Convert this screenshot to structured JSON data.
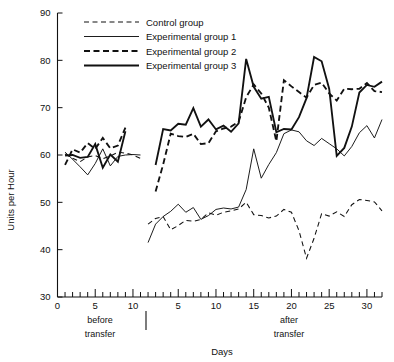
{
  "chart_data": {
    "type": "line",
    "title": "",
    "xlabel": "Days",
    "ylabel": "Units per Hour",
    "ylim": [
      30,
      90
    ],
    "y_ticks": [
      30,
      40,
      50,
      60,
      70,
      80,
      90
    ],
    "grid": false,
    "legend_position": "top-left",
    "x_sections": [
      {
        "name": "before transfer",
        "label_line1": "before",
        "label_line2": "transfer",
        "xlim": [
          0,
          11
        ],
        "ticks_labeled": [
          0,
          5,
          10
        ],
        "tick_step": 1
      },
      {
        "name": "after transfer",
        "label_line1": "after",
        "label_line2": "transfer",
        "xlim": [
          0,
          32
        ],
        "ticks_labeled": [
          5,
          10,
          15,
          20,
          25,
          30
        ],
        "tick_step": 1
      }
    ],
    "series": [
      {
        "name": "Control group",
        "style": "thin-dashed",
        "before": {
          "x": [
            1,
            2,
            3,
            4,
            5,
            6,
            7,
            8,
            9,
            10,
            11
          ],
          "y": [
            60.2,
            59.3,
            58.6,
            59.6,
            59.9,
            59.2,
            59.8,
            60.6,
            60.4,
            60.0,
            59.3
          ]
        },
        "after": {
          "x": [
            1,
            2,
            3,
            4,
            5,
            6,
            7,
            8,
            9,
            10,
            11,
            12,
            13,
            14,
            15,
            16,
            17,
            18,
            19,
            20,
            21,
            22,
            23,
            24,
            25,
            26,
            27,
            28,
            29,
            30,
            31,
            32
          ],
          "y": [
            45.4,
            46.6,
            47.0,
            44.2,
            45.1,
            46.2,
            46.0,
            46.4,
            47.8,
            47.3,
            47.9,
            48.2,
            48.6,
            50.0,
            47.4,
            47.2,
            46.7,
            47.1,
            48.5,
            47.9,
            44.0,
            38.2,
            42.4,
            47.6,
            47.1,
            48.0,
            47.0,
            49.5,
            50.6,
            50.4,
            50.1,
            48.2
          ]
        }
      },
      {
        "name": "Experimental group 1",
        "style": "thin-solid",
        "before": {
          "x": [
            1,
            2,
            3,
            4,
            5,
            6,
            7,
            8,
            9,
            10,
            11
          ],
          "y": [
            60.6,
            59.1,
            57.5,
            55.8,
            58.2,
            61.3,
            57.7,
            59.7,
            60.0,
            60.1,
            60.0
          ]
        },
        "after": {
          "x": [
            1,
            2,
            3,
            4,
            5,
            6,
            7,
            8,
            9,
            10,
            11,
            12,
            13,
            14,
            15,
            16,
            17,
            18,
            19,
            20,
            21,
            22,
            23,
            24,
            25,
            26,
            27,
            28,
            29,
            30,
            31,
            32
          ],
          "y": [
            41.5,
            45.4,
            47.0,
            48.1,
            49.6,
            47.9,
            48.9,
            46.4,
            47.2,
            48.5,
            48.8,
            48.6,
            49.0,
            52.7,
            61.3,
            55.1,
            58.0,
            60.5,
            64.5,
            65.3,
            64.9,
            63.0,
            62.0,
            63.5,
            62.4,
            61.3,
            59.8,
            61.8,
            64.7,
            66.2,
            63.6,
            67.5
          ]
        }
      },
      {
        "name": "Experimental group 2",
        "style": "thick-dashed",
        "before": {
          "x": [
            1,
            2,
            3,
            4,
            5,
            6,
            7,
            8,
            9
          ],
          "y": [
            57.9,
            61.2,
            60.5,
            62.5,
            61.3,
            63.6,
            61.4,
            62.0,
            65.8
          ]
        },
        "after": {
          "x": [
            2,
            3,
            4,
            5,
            6,
            7,
            8,
            9,
            10,
            11,
            12,
            13,
            14,
            15,
            16,
            17,
            18,
            19,
            20,
            21,
            22,
            23,
            24,
            25,
            26,
            27,
            28,
            29,
            30,
            31,
            32
          ],
          "y": [
            52.3,
            58.0,
            64.5,
            64.0,
            63.8,
            64.5,
            62.3,
            62.5,
            65.0,
            65.6,
            66.0,
            67.0,
            72.2,
            74.9,
            73.0,
            70.0,
            62.9,
            75.8,
            74.5,
            73.3,
            72.1,
            74.8,
            75.3,
            73.0,
            71.5,
            74.0,
            73.9,
            74.0,
            75.2,
            73.5,
            73.3
          ]
        }
      },
      {
        "name": "Experimental group 3",
        "style": "thick-solid",
        "before": {
          "x": [
            1,
            2,
            3,
            4,
            5,
            6,
            7,
            8,
            9
          ],
          "y": [
            59.9,
            60.0,
            59.4,
            59.6,
            62.3,
            57.3,
            60.1,
            58.6,
            65.0
          ]
        },
        "after": {
          "x": [
            2,
            3,
            4,
            5,
            6,
            7,
            8,
            9,
            10,
            11,
            12,
            13,
            14,
            15,
            16,
            17,
            18,
            19,
            20,
            21,
            22,
            23,
            24,
            25,
            26,
            27,
            28,
            29,
            30,
            31,
            32
          ],
          "y": [
            57.9,
            65.5,
            65.2,
            66.6,
            66.4,
            69.9,
            66.0,
            67.5,
            65.4,
            66.2,
            64.9,
            66.7,
            80.3,
            74.4,
            71.9,
            72.3,
            64.8,
            65.5,
            65.4,
            68.0,
            72.0,
            80.7,
            79.8,
            74.0,
            59.8,
            61.5,
            66.0,
            73.2,
            74.8,
            74.4,
            75.5
          ]
        }
      }
    ]
  },
  "legend": {
    "items": [
      {
        "label": "Control group",
        "style": "thin-dashed"
      },
      {
        "label": "Experimental group 1",
        "style": "thin-solid"
      },
      {
        "label": "Experimental group 2",
        "style": "thick-dashed"
      },
      {
        "label": "Experimental group 3",
        "style": "thick-solid"
      }
    ]
  },
  "axes": {
    "y_label": "Units per Hour",
    "x_label": "Days",
    "y_tick_labels": [
      "30",
      "40",
      "50",
      "60",
      "70",
      "80",
      "90"
    ],
    "x_tick_labels_before": [
      "0",
      "5",
      "10"
    ],
    "x_tick_labels_after": [
      "5",
      "10",
      "15",
      "20",
      "25",
      "30"
    ]
  },
  "annotations": {
    "before_line1": "before",
    "before_line2": "transfer",
    "after_line1": "after",
    "after_line2": "transfer"
  },
  "colors": {
    "ink": "#111111",
    "background": "#ffffff"
  }
}
